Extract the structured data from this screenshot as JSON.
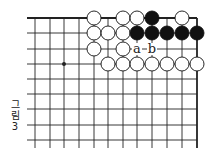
{
  "caption": {
    "lines": [
      "그",
      "림",
      "3"
    ],
    "text": "그림 3"
  },
  "board": {
    "x_lines": [
      35,
      50,
      64,
      79,
      94,
      108,
      123,
      137,
      152,
      167,
      182,
      197
    ],
    "y_lines": [
      18,
      33,
      49,
      64,
      79,
      94,
      109,
      125,
      140
    ],
    "line_left": 27,
    "line_bottom": 148,
    "top_edge": true,
    "right_edge": true,
    "stone_radius": 7,
    "colors": {
      "line": "#222222",
      "black": "#111111",
      "white": "#ffffff",
      "edge": "#111111"
    },
    "star_points": [
      {
        "col": 2,
        "row": 3
      }
    ],
    "stones": [
      {
        "color": "white",
        "col": 4,
        "row": 0
      },
      {
        "color": "white",
        "col": 6,
        "row": 0
      },
      {
        "color": "white",
        "col": 7,
        "row": 0
      },
      {
        "color": "black",
        "col": 8,
        "row": 0
      },
      {
        "color": "white",
        "col": 10,
        "row": 0
      },
      {
        "color": "white",
        "col": 4,
        "row": 1
      },
      {
        "color": "white",
        "col": 5,
        "row": 1
      },
      {
        "color": "white",
        "col": 6,
        "row": 1
      },
      {
        "color": "black",
        "col": 7,
        "row": 1
      },
      {
        "color": "black",
        "col": 8,
        "row": 1
      },
      {
        "color": "black",
        "col": 9,
        "row": 1
      },
      {
        "color": "black",
        "col": 10,
        "row": 1
      },
      {
        "color": "black",
        "col": 11,
        "row": 1
      },
      {
        "color": "white",
        "col": 4,
        "row": 2
      },
      {
        "color": "white",
        "col": 6,
        "row": 2
      },
      {
        "color": "white",
        "col": 5,
        "row": 3
      },
      {
        "color": "white",
        "col": 6,
        "row": 3
      },
      {
        "color": "white",
        "col": 7,
        "row": 3
      },
      {
        "color": "white",
        "col": 8,
        "row": 3
      },
      {
        "color": "white",
        "col": 9,
        "row": 3
      },
      {
        "color": "white",
        "col": 10,
        "row": 3
      },
      {
        "color": "white",
        "col": 11,
        "row": 3
      }
    ],
    "labels": [
      {
        "text": "a",
        "col": 7,
        "row": 2
      },
      {
        "text": "b",
        "col": 8,
        "row": 2
      }
    ]
  }
}
